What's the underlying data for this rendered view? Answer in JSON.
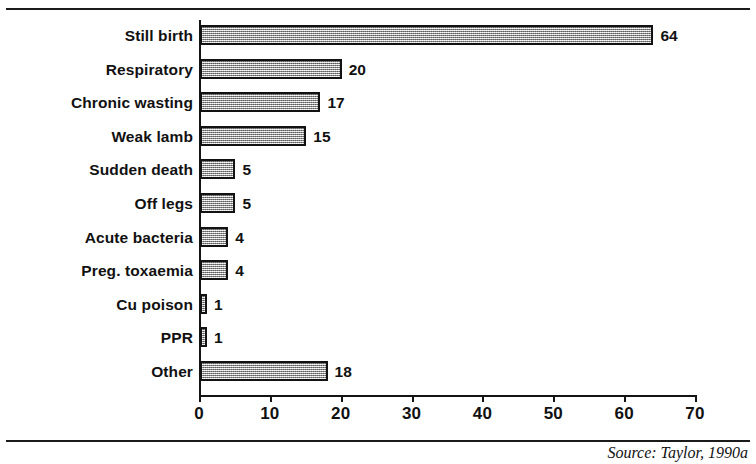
{
  "chart_data": {
    "type": "bar",
    "orientation": "horizontal",
    "title": "",
    "subtitle": "",
    "xlabel": "",
    "ylabel": "",
    "xlim": [
      0,
      70
    ],
    "x_ticks": [
      0,
      10,
      20,
      30,
      40,
      50,
      60,
      70
    ],
    "x_tick_labels": [
      "0",
      "10",
      "20",
      "30",
      "40",
      "50",
      "60",
      "70"
    ],
    "grid": false,
    "legend": null,
    "legend_position": "none",
    "categories": [
      "Still birth",
      "Respiratory",
      "Chronic wasting",
      "Weak lamb",
      "Sudden death",
      "Off legs",
      "Acute bacteria",
      "Preg. toxaemia",
      "Cu poison",
      "PPR",
      "Other"
    ],
    "values": [
      64,
      20,
      17,
      15,
      5,
      5,
      4,
      4,
      1,
      1,
      18
    ],
    "value_labels": [
      "64",
      "20",
      "17",
      "15",
      "5",
      "5",
      "4",
      "4",
      "1",
      "1",
      "18"
    ],
    "series": [
      {
        "name": "Count",
        "values": [
          64,
          20,
          17,
          15,
          5,
          5,
          4,
          4,
          1,
          1,
          18
        ]
      }
    ],
    "bar_fill": "#b9b9b9",
    "bar_border": "#121212",
    "axis_color": "#141414"
  },
  "figure": {
    "source_note": "Source: Taylor, 1990a"
  }
}
